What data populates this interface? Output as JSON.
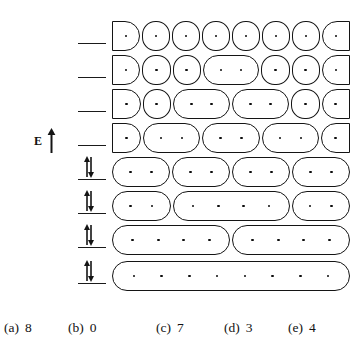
{
  "figure": {
    "axis": {
      "label": "E",
      "arrow_icon": "up-arrow-icon",
      "direction": "up",
      "x": 34,
      "y": 128
    },
    "dot_count_per_level": 8,
    "levels": [
      {
        "index": 1,
        "y": 18,
        "occupancy": "empty",
        "spin_symbol": "",
        "line_x": 78,
        "line_width": 28,
        "track_x": 112,
        "track_width": 238,
        "groups": [
          1,
          1,
          1,
          1,
          1,
          1,
          1,
          1
        ]
      },
      {
        "index": 2,
        "y": 52,
        "occupancy": "empty",
        "spin_symbol": "",
        "line_x": 78,
        "line_width": 28,
        "track_x": 112,
        "track_width": 238,
        "groups": [
          1,
          1,
          1,
          2,
          1,
          1,
          1
        ]
      },
      {
        "index": 3,
        "y": 86,
        "occupancy": "empty",
        "spin_symbol": "",
        "line_x": 78,
        "line_width": 28,
        "track_x": 112,
        "track_width": 238,
        "groups": [
          1,
          1,
          2,
          2,
          1,
          1
        ]
      },
      {
        "index": 4,
        "y": 120,
        "occupancy": "empty",
        "spin_symbol": "",
        "line_x": 78,
        "line_width": 28,
        "track_x": 112,
        "track_width": 238,
        "groups": [
          1,
          2,
          2,
          2,
          1
        ]
      },
      {
        "index": 5,
        "y": 154,
        "occupancy": "paired",
        "spin_symbol": "paired-arrows-icon",
        "line_x": 78,
        "line_width": 28,
        "track_x": 112,
        "track_width": 238,
        "groups": [
          2,
          2,
          2,
          2
        ]
      },
      {
        "index": 6,
        "y": 188,
        "occupancy": "paired",
        "spin_symbol": "paired-arrows-icon",
        "line_x": 78,
        "line_width": 28,
        "track_x": 112,
        "track_width": 238,
        "groups": [
          2,
          4,
          2
        ]
      },
      {
        "index": 7,
        "y": 222,
        "occupancy": "paired",
        "spin_symbol": "paired-arrows-icon",
        "line_x": 78,
        "line_width": 28,
        "track_x": 112,
        "track_width": 238,
        "groups": [
          4,
          4
        ]
      },
      {
        "index": 8,
        "y": 258,
        "occupancy": "paired",
        "spin_symbol": "paired-arrows-icon",
        "line_x": 78,
        "line_width": 28,
        "track_x": 112,
        "track_width": 238,
        "groups": [
          8
        ]
      }
    ]
  },
  "answers": [
    {
      "tag": "(a)",
      "value": "8",
      "x": 4
    },
    {
      "tag": "(b)",
      "value": "0",
      "x": 68
    },
    {
      "tag": "(c)",
      "value": "7",
      "x": 156
    },
    {
      "tag": "(d)",
      "value": "3",
      "x": 224
    },
    {
      "tag": "(e)",
      "value": "4",
      "x": 288
    }
  ],
  "colors": {
    "ink": "#141414",
    "background": "#ffffff"
  }
}
